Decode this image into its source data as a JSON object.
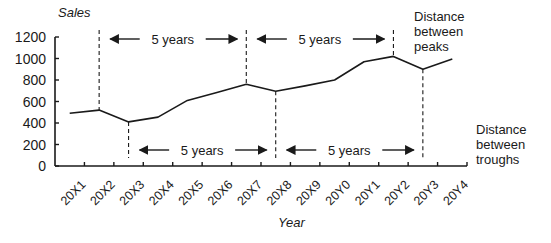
{
  "chart_data": {
    "type": "line",
    "title": "",
    "xlabel": "Year",
    "ylabel": "Sales",
    "ylim": [
      0,
      1200
    ],
    "yticks": [
      0,
      200,
      400,
      600,
      800,
      1000,
      1200
    ],
    "grid": false,
    "legend": null,
    "categories": [
      "20X1",
      "20X2",
      "20X3",
      "20X4",
      "20X5",
      "20X6",
      "20X7",
      "20X8",
      "20X9",
      "20Y0",
      "20Y1",
      "20Y2",
      "20Y3",
      "20Y4"
    ],
    "series": [
      {
        "name": "Sales",
        "values": [
          490,
          520,
          410,
          455,
          610,
          685,
          760,
          695,
          745,
          800,
          970,
          1020,
          900,
          995
        ]
      }
    ],
    "annotations": {
      "peaks": {
        "label": "Distance between peaks",
        "peak_categories": [
          "20X2",
          "20X7",
          "20Y2"
        ],
        "intervals": [
          {
            "from": "20X2",
            "to": "20X7",
            "label": "5 years"
          },
          {
            "from": "20X7",
            "to": "20Y2",
            "label": "5 years"
          }
        ]
      },
      "troughs": {
        "label": "Distance between troughs",
        "trough_categories": [
          "20X3",
          "20X8",
          "20Y3"
        ],
        "intervals": [
          {
            "from": "20X3",
            "to": "20X8",
            "label": "5 years"
          },
          {
            "from": "20X8",
            "to": "20Y3",
            "label": "5 years"
          }
        ]
      }
    }
  },
  "labels": {
    "ylabel": "Sales",
    "xlabel": "Year",
    "interval": "5 years",
    "peaks_line1": "Distance",
    "peaks_line2": "between",
    "peaks_line3": "peaks",
    "troughs_line1": "Distance",
    "troughs_line2": "between",
    "troughs_line3": "troughs"
  }
}
